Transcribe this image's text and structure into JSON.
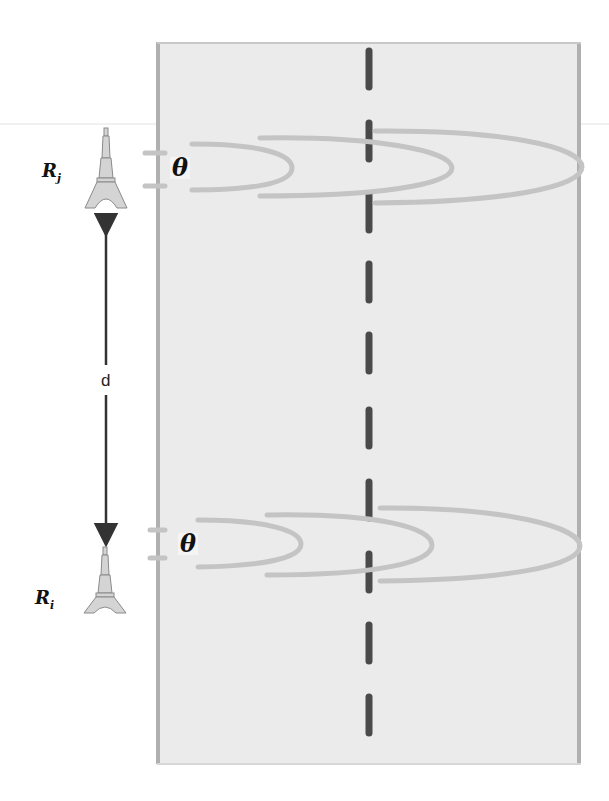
{
  "diagram": {
    "road": {
      "fill": "#ebebeb",
      "edge_color": "#b0b0b0",
      "center_line_color": "#4a4a4a",
      "center_line_style": "dashed"
    },
    "towers": [
      {
        "id": "Rj",
        "label_base": "R",
        "label_sub": "j",
        "icon": "eiffel-tower-icon",
        "y": 170
      },
      {
        "id": "Ri",
        "label_base": "R",
        "label_sub": "i",
        "icon": "eiffel-tower-icon",
        "y": 578
      }
    ],
    "distance_label": "d",
    "angle_label_top": "θ",
    "angle_label_bottom": "θ",
    "signal_color": "#c4c4c4"
  }
}
